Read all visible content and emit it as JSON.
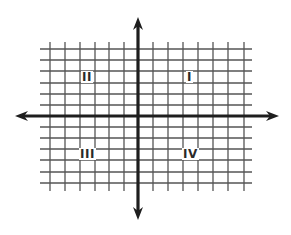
{
  "diagram": {
    "type": "coordinate-plane",
    "axes": {
      "color": "#1e1e1e",
      "x_axis": {
        "y": 116,
        "x_start_arrow_tip": 15,
        "x_end_arrow_tip": 279
      },
      "y_axis": {
        "x": 138,
        "y_top_arrow_tip": 17,
        "y_bottom_arrow_tip": 220
      }
    },
    "grid": {
      "color": "#555555",
      "vertical_lines_x": [
        50,
        65,
        80,
        95,
        109,
        124,
        153,
        168,
        183,
        198,
        213,
        228,
        244
      ],
      "horizontal_lines_y": [
        49,
        60,
        71,
        83,
        94,
        105,
        127,
        138,
        149,
        160,
        172,
        183
      ],
      "horizontal_extent": [
        40,
        252
      ],
      "vertical_extent": [
        42,
        191
      ]
    },
    "quadrants": [
      {
        "id": "I",
        "label": "I",
        "x": 186,
        "y": 71
      },
      {
        "id": "II",
        "label": "II",
        "x": 81,
        "y": 71
      },
      {
        "id": "III",
        "label": "III",
        "x": 79,
        "y": 148
      },
      {
        "id": "IV",
        "label": "IV",
        "x": 182,
        "y": 148
      }
    ]
  }
}
